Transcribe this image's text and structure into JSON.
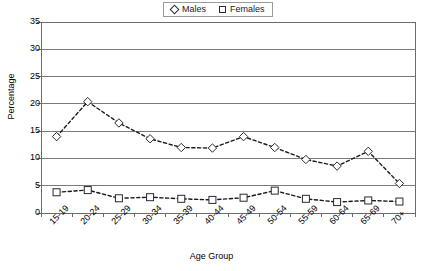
{
  "chart_data": {
    "type": "line",
    "title": "",
    "xlabel": "Age Group",
    "ylabel": "Percentage",
    "categories": [
      "15-19",
      "20-24",
      "25-29",
      "30-34",
      "35-39",
      "40-44",
      "45-49",
      "50-54",
      "55-59",
      "60-64",
      "65-69",
      "70+"
    ],
    "series": [
      {
        "name": "Males",
        "marker": "diamond",
        "values": [
          14.0,
          20.4,
          16.5,
          13.6,
          12.0,
          11.9,
          14.0,
          12.0,
          9.8,
          8.6,
          11.3,
          5.4
        ]
      },
      {
        "name": "Females",
        "marker": "square",
        "values": [
          3.8,
          4.2,
          2.7,
          2.9,
          2.6,
          2.4,
          2.8,
          4.1,
          2.6,
          2.0,
          2.3,
          2.1
        ]
      }
    ],
    "ylim": [
      0,
      35
    ],
    "yticks": [
      0,
      5,
      10,
      15,
      20,
      25,
      30,
      35
    ],
    "ytick_labels": [
      "0",
      "5",
      "10",
      "15",
      "20",
      "25",
      "30",
      "35"
    ],
    "grid": "horizontal",
    "legend_position": "top-center"
  },
  "legend": {
    "entries": [
      {
        "label": "Males",
        "marker": "diamond"
      },
      {
        "label": "Females",
        "marker": "square"
      }
    ]
  },
  "axes": {
    "y_title": "Percentage",
    "x_title": "Age Group"
  },
  "colors": {
    "axis": "#6b6b6b",
    "grid": "#7a7a7a",
    "series_line": "#1a1a1a",
    "marker_fill": "#ffffff",
    "marker_stroke": "#2a2a2a",
    "background": "#ffffff"
  }
}
